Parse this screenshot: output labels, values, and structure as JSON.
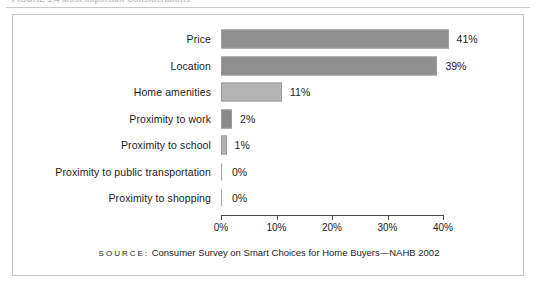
{
  "figure": {
    "caption": "FIGURE 1.4  Most Important Considerations",
    "source_word": "SOURCE:",
    "source_text": "Consumer Survey on Smart Choices for Home Buyers—NAHB 2002"
  },
  "chart_data": {
    "type": "bar",
    "orientation": "horizontal",
    "title": "FIGURE 1.4  Most Important Considerations",
    "xlabel": "",
    "ylabel": "",
    "xlim": [
      0,
      40
    ],
    "xticks": [
      "0%",
      "10%",
      "20%",
      "30%",
      "40%"
    ],
    "xtick_values": [
      0,
      10,
      20,
      30,
      40
    ],
    "grid": false,
    "legend": "none",
    "categories": [
      "Price",
      "Location",
      "Home amenities",
      "Proximity to work",
      "Proximity to school",
      "Proximity to public transportation",
      "Proximity to shopping"
    ],
    "values": [
      41,
      39,
      11,
      2,
      1,
      0,
      0
    ],
    "data_labels": [
      "41%",
      "39%",
      "11%",
      "2%",
      "1%",
      "0%",
      "0%"
    ],
    "bar_colors": [
      "#8f8f8f",
      "#8f8f8f",
      "#b4b4b4",
      "#8a8a8a",
      "#b0b0b0",
      "#a8a8a8",
      "#a8a8a8"
    ],
    "annotation": "SOURCE: Consumer Survey on Smart Choices for Home Buyers—NAHB 2002"
  }
}
